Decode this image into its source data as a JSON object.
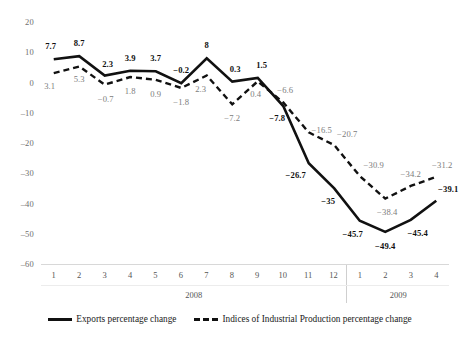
{
  "chart_data": {
    "type": "line",
    "title": "",
    "subtitle": "",
    "xlabel": "",
    "ylabel": "",
    "ylim": [
      -60,
      20
    ],
    "ytick_labels": [
      "20",
      "10",
      "0",
      "–10",
      "–20",
      "–30",
      "–40",
      "–50",
      "–60"
    ],
    "ytick_values": [
      20,
      10,
      0,
      -10,
      -20,
      -30,
      -40,
      -50,
      -60
    ],
    "grid": false,
    "legend_position": "bottom-center",
    "categories": [
      "1",
      "2",
      "3",
      "4",
      "5",
      "6",
      "7",
      "8",
      "9",
      "10",
      "11",
      "12",
      "1",
      "2",
      "3",
      "4"
    ],
    "group_labels": [
      {
        "label": "2008",
        "span": 12
      },
      {
        "label": "2009",
        "span": 4
      }
    ],
    "series": [
      {
        "name": "Exports percentage change",
        "style": "solid",
        "color": "#111111",
        "label_color": "#111111",
        "values": [
          7.7,
          8.7,
          2.3,
          3.9,
          3.7,
          -0.2,
          8,
          0.3,
          1.5,
          -7.8,
          -26.7,
          -35,
          -45.7,
          -49.4,
          -45.4,
          -39.1
        ],
        "point_labels": [
          "7.7",
          "8.7",
          "2.3",
          "3.9",
          "3.7",
          "−0.2",
          "8",
          "0.3",
          "1.5",
          "−7.8",
          "−26.7",
          "−35",
          "−45.7",
          "−49.4",
          "−45.4",
          "−39.1"
        ]
      },
      {
        "name": "Indices of Industrial Production percentage change",
        "style": "dashed",
        "color": "#111111",
        "label_color": "#7c7c7c",
        "values": [
          3.1,
          5.3,
          -0.7,
          1.8,
          0.9,
          -1.8,
          2.3,
          -7.2,
          0.4,
          -6.6,
          -16.5,
          -20.7,
          -30.9,
          -38.4,
          -34.2,
          -31.2
        ],
        "point_labels": [
          "3.1",
          "5.3",
          "−0.7",
          "1.8",
          "0.9",
          "−1.8",
          "2.3",
          "−7.2",
          "0.4",
          "−6.6",
          "−16.5",
          "−20.7",
          "−30.9",
          "−38.4",
          "−34.2",
          "−31.2"
        ]
      }
    ]
  },
  "legend": {
    "items": [
      {
        "label": "Exports percentage change",
        "style": "solid"
      },
      {
        "label": "Indices of Industrial Production percentage change",
        "style": "dashed"
      }
    ]
  }
}
